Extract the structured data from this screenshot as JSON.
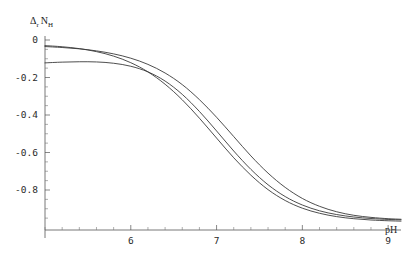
{
  "chart_data": {
    "type": "line",
    "title": "",
    "subtitle": "",
    "xlabel": "pH",
    "ylabel": "Δr NH",
    "ylabel_parts": {
      "delta": "Δ",
      "delta_sub": "r",
      "n": "N",
      "n_sub": "H"
    },
    "xlim": [
      5.0,
      9.15
    ],
    "ylim": [
      -1.01,
      0.04
    ],
    "grid": false,
    "legend": null,
    "x_ticks": [
      6,
      7,
      8,
      9
    ],
    "x_tick_labels": [
      "6",
      "7",
      "8",
      "9"
    ],
    "x_minor_tick_step": 0.2,
    "y_ticks": [
      0,
      -0.2,
      -0.4,
      -0.6,
      -0.8
    ],
    "y_tick_labels": [
      "0",
      "-0.2",
      "-0.4",
      "-0.6",
      "-0.8"
    ],
    "y_minor_tick_step": 0.05,
    "x": [
      5.0,
      5.2,
      5.4,
      5.6,
      5.8,
      6.0,
      6.2,
      6.4,
      6.6,
      6.8,
      7.0,
      7.2,
      7.4,
      7.6,
      7.8,
      8.0,
      8.2,
      8.4,
      8.6,
      8.8,
      9.0,
      9.15
    ],
    "series": [
      {
        "name": "curve-1",
        "color": "#3a3a3a",
        "values": [
          -0.035,
          -0.04,
          -0.047,
          -0.058,
          -0.074,
          -0.097,
          -0.13,
          -0.176,
          -0.238,
          -0.318,
          -0.412,
          -0.515,
          -0.618,
          -0.71,
          -0.786,
          -0.845,
          -0.887,
          -0.916,
          -0.935,
          -0.946,
          -0.953,
          -0.956
        ]
      },
      {
        "name": "curve-2",
        "color": "#3a3a3a",
        "values": [
          -0.03,
          -0.036,
          -0.046,
          -0.062,
          -0.086,
          -0.121,
          -0.17,
          -0.236,
          -0.319,
          -0.417,
          -0.523,
          -0.628,
          -0.721,
          -0.798,
          -0.856,
          -0.897,
          -0.924,
          -0.942,
          -0.953,
          -0.96,
          -0.964,
          -0.966
        ]
      },
      {
        "name": "curve-3",
        "color": "#3a3a3a",
        "values": [
          -0.122,
          -0.118,
          -0.116,
          -0.117,
          -0.124,
          -0.14,
          -0.17,
          -0.219,
          -0.29,
          -0.381,
          -0.485,
          -0.592,
          -0.69,
          -0.772,
          -0.835,
          -0.88,
          -0.911,
          -0.931,
          -0.944,
          -0.952,
          -0.957,
          -0.959
        ]
      }
    ],
    "annotations": []
  },
  "axes": {
    "x_axis_label": "pH",
    "y_axis_label": "Δr NH"
  },
  "colors": {
    "curve": "#3a3a3a",
    "axis": "#555555",
    "text": "#2b2b2b",
    "background": "#ffffff"
  }
}
